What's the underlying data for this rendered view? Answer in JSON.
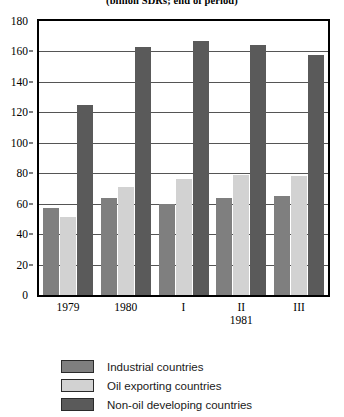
{
  "chart_data": {
    "type": "bar",
    "title": "(billion SDRs; end of period)",
    "subtitle": "",
    "xlabel": "",
    "ylabel": "",
    "ylim": [
      0,
      180
    ],
    "ytick_step": 20,
    "yticks": [
      0,
      20,
      40,
      60,
      80,
      100,
      120,
      140,
      160,
      180
    ],
    "grid": true,
    "legend_position": "bottom",
    "categories": [
      "1979",
      "1980",
      "I",
      "II",
      "III"
    ],
    "category_sublabels": [
      "",
      "",
      "",
      "1981",
      ""
    ],
    "series": [
      {
        "name": "Industrial countries",
        "color": "#7f7f7f",
        "values": [
          57,
          64,
          60,
          64,
          65
        ]
      },
      {
        "name": "Oil exporting countries",
        "color": "#d2d2d2",
        "values": [
          51,
          71,
          76,
          79,
          78
        ]
      },
      {
        "name": "Non-oil developing countries",
        "color": "#5a5a5a",
        "values": [
          125,
          163,
          167,
          164,
          158
        ]
      }
    ]
  },
  "legend": {
    "items": [
      {
        "label": "Industrial countries"
      },
      {
        "label": "Oil exporting countries"
      },
      {
        "label": "Non-oil developing countries"
      }
    ]
  }
}
